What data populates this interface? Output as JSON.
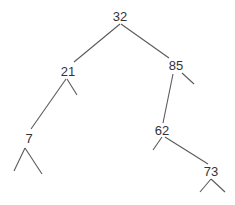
{
  "diagram": {
    "type": "binary-search-tree",
    "colors": {
      "edge": "#5a5a5a",
      "text": "#333333",
      "background": "#ffffff"
    },
    "nodes": [
      {
        "id": "n32",
        "label": "32",
        "x": 120,
        "y": 16
      },
      {
        "id": "n21",
        "label": "21",
        "x": 68,
        "y": 71
      },
      {
        "id": "n85",
        "label": "85",
        "x": 176,
        "y": 65
      },
      {
        "id": "n7",
        "label": "7",
        "x": 29,
        "y": 138
      },
      {
        "id": "n62",
        "label": "62",
        "x": 162,
        "y": 130
      },
      {
        "id": "n73",
        "label": "73",
        "x": 211,
        "y": 171
      }
    ],
    "edges": [
      {
        "from": "n32",
        "to": "n21",
        "x1": 120,
        "y1": 24,
        "x2": 74,
        "y2": 62
      },
      {
        "from": "n32",
        "to": "n85",
        "x1": 121,
        "y1": 24,
        "x2": 169,
        "y2": 58
      },
      {
        "from": "n21",
        "to": "n7",
        "x1": 66,
        "y1": 79,
        "x2": 31,
        "y2": 129
      },
      {
        "from": "n21",
        "to": "null-right",
        "x1": 67,
        "y1": 79,
        "x2": 77,
        "y2": 95
      },
      {
        "from": "n85",
        "to": "n62",
        "x1": 173,
        "y1": 74,
        "x2": 163,
        "y2": 123
      },
      {
        "from": "n85",
        "to": "null-right",
        "x1": 182,
        "y1": 73,
        "x2": 194,
        "y2": 84
      },
      {
        "from": "n7",
        "to": "null-left",
        "x1": 25,
        "y1": 148,
        "x2": 14,
        "y2": 171
      },
      {
        "from": "n7",
        "to": "null-right",
        "x1": 25,
        "y1": 148,
        "x2": 42,
        "y2": 174
      },
      {
        "from": "n62",
        "to": "null-left",
        "x1": 162,
        "y1": 137,
        "x2": 153,
        "y2": 150
      },
      {
        "from": "n62",
        "to": "n73",
        "x1": 165,
        "y1": 137,
        "x2": 208,
        "y2": 164
      },
      {
        "from": "n73",
        "to": "null-left",
        "x1": 211,
        "y1": 179,
        "x2": 200,
        "y2": 192
      },
      {
        "from": "n73",
        "to": "null-right",
        "x1": 211,
        "y1": 179,
        "x2": 225,
        "y2": 192
      }
    ]
  }
}
